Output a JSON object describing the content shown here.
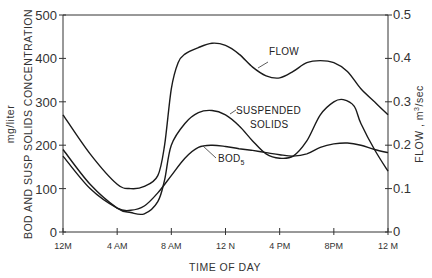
{
  "chart_data": {
    "type": "line",
    "title": "",
    "xlabel": "TIME OF DAY",
    "ylabel_left": "BOD AND SUSP SOLIDS CONCENTRATION mg/liter",
    "ylabel_left_line1": "BOD AND SUSP SOLIDS CONCENTRATION",
    "ylabel_left_line2": "mg/liter",
    "ylabel_right": "FLOW , m³/sec",
    "ylim_left": [
      0,
      500
    ],
    "ylim_right": [
      0,
      0.5
    ],
    "yticks_left": [
      "0",
      "100",
      "200",
      "300",
      "400",
      "500"
    ],
    "yticks_right": [
      "0",
      "0.1",
      "0.2",
      "0.3",
      "0.4",
      "0.5"
    ],
    "x_hours": [
      0,
      4,
      8,
      12,
      16,
      20,
      24
    ],
    "xtick_labels": [
      "12M",
      "4 AM",
      "8 AM",
      "12 N",
      "4 PM",
      "8PM",
      "12 M"
    ],
    "grid": false,
    "legend": "inline labels",
    "series": [
      {
        "name": "FLOW",
        "axis": "right",
        "x": [
          0,
          2,
          4,
          5,
          6,
          7,
          7.5,
          8,
          8.5,
          9,
          10,
          11,
          12,
          13,
          14,
          15,
          16,
          17,
          18,
          19,
          20,
          21,
          22,
          23,
          24
        ],
        "values": [
          0.27,
          0.18,
          0.11,
          0.1,
          0.105,
          0.13,
          0.2,
          0.33,
          0.39,
          0.41,
          0.425,
          0.435,
          0.43,
          0.41,
          0.38,
          0.36,
          0.355,
          0.37,
          0.39,
          0.395,
          0.39,
          0.37,
          0.33,
          0.3,
          0.27
        ]
      },
      {
        "name": "SUSPENDED SOLIDS",
        "axis": "left",
        "x": [
          0,
          2,
          4,
          5,
          6,
          7,
          7.5,
          8,
          9,
          10,
          11,
          12,
          13,
          14,
          15,
          16,
          17,
          18,
          19,
          20,
          20.7,
          21.5,
          22,
          23,
          24
        ],
        "values": [
          190,
          110,
          55,
          45,
          42,
          70,
          120,
          200,
          250,
          275,
          280,
          270,
          245,
          210,
          180,
          170,
          175,
          210,
          270,
          300,
          305,
          290,
          250,
          190,
          140
        ]
      },
      {
        "name": "BOD5",
        "axis": "left",
        "x": [
          0,
          2,
          4,
          5,
          6,
          7,
          8,
          9,
          10,
          11,
          12,
          13,
          14,
          15,
          16,
          17,
          18,
          19,
          20,
          21,
          22,
          23,
          24
        ],
        "values": [
          175,
          100,
          55,
          50,
          60,
          90,
          130,
          170,
          195,
          200,
          197,
          192,
          188,
          183,
          178,
          175,
          180,
          195,
          203,
          205,
          200,
          190,
          183
        ]
      }
    ],
    "annotations": [
      "FLOW",
      "SUSPENDED SOLIDS",
      "BOD5"
    ]
  },
  "labels": {
    "flow": "FLOW",
    "suspended_1": "SUSPENDED",
    "suspended_2": "SOLIDS",
    "bod": "BOD",
    "bod_sub": "5",
    "xlabel": "TIME OF DAY",
    "ylabel_left_line1": "BOD AND SUSP SOLIDS CONCENTRATION",
    "ylabel_left_line2": "mg/liter",
    "ylabel_right_pre": "FLOW , m",
    "ylabel_right_sup": "3",
    "ylabel_right_post": "/sec"
  }
}
